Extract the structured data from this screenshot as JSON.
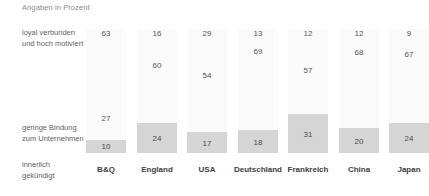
{
  "caption": "Angaben in Prozent",
  "row_labels": {
    "loyal": "loyal verbunden\nund hoch motiviert",
    "loyal_line1": "loyal verbunden",
    "loyal_line2": "und hoch motiviert",
    "low_line1": "geringe Bindung",
    "low_line2": "zum Unternehmen",
    "quit_line1": "innerlich",
    "quit_line2": "gekündigt"
  },
  "colors": {
    "bar": "#d5d5d5",
    "band": "#fafafa",
    "text": "#5f5f5f",
    "category_text": "#3d3d3d"
  },
  "chart_data": {
    "type": "bar",
    "title": "",
    "subtitle": "Angaben in Prozent",
    "xlabel": "",
    "ylabel": "",
    "ylim": [
      0,
      100
    ],
    "grid": false,
    "legend_position": "left-labels",
    "categories": [
      "B&Q",
      "England",
      "USA",
      "Deutschland",
      "Frankreich",
      "China",
      "Japan"
    ],
    "series": [
      {
        "name": "loyal verbunden und hoch motiviert",
        "values": [
          63,
          16,
          29,
          13,
          12,
          12,
          9
        ]
      },
      {
        "name": "geringe Bindung zum Unternehmen",
        "values": [
          27,
          60,
          54,
          69,
          57,
          68,
          67
        ]
      },
      {
        "name": "innerlich gekündigt",
        "values": [
          10,
          24,
          17,
          18,
          31,
          20,
          24
        ]
      }
    ],
    "annotations": [
      "Bars drawn only for the 'innerlich gekündigt' series",
      "Remaining values shown as plain numbers positioned by magnitude"
    ]
  }
}
